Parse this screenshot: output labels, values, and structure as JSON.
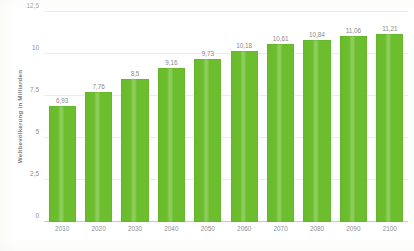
{
  "chart_data": {
    "type": "bar",
    "title": "",
    "subtitle": "",
    "xlabel": "",
    "ylabel": "Weltbevölkerung in Milliarden",
    "categories": [
      "2010",
      "2020",
      "2030",
      "2040",
      "2050",
      "2060",
      "2070",
      "2080",
      "2090",
      "2100"
    ],
    "values": [
      6.93,
      7.76,
      8.5,
      9.16,
      9.73,
      10.18,
      10.61,
      10.84,
      11.06,
      11.21
    ],
    "value_labels": [
      "6,93",
      "7,76",
      "8,5",
      "9,16",
      "9,73",
      "10,18",
      "10,61",
      "10,84",
      "11,06",
      "11,21"
    ],
    "ylim": [
      0,
      12.5
    ],
    "y_ticks": [
      0,
      2.5,
      5,
      7.5,
      10,
      12.5
    ],
    "y_tick_labels": [
      "0",
      "2,5",
      "5",
      "7,5",
      "10",
      "12,5"
    ],
    "grid": true,
    "legend": null,
    "legend_position": "none",
    "series": [
      {
        "name": "Weltbevölkerung in Milliarden",
        "values": [
          6.93,
          7.76,
          8.5,
          9.16,
          9.73,
          10.18,
          10.61,
          10.84,
          11.06,
          11.21
        ]
      }
    ],
    "colors": {
      "bar": "#6CBE2F",
      "bar_highlight": "#8CCD5B",
      "gridline": "#ECECEC",
      "axis": "#C8C8C8",
      "text": "#8D8D8D",
      "background": "#FFFFFF"
    }
  }
}
